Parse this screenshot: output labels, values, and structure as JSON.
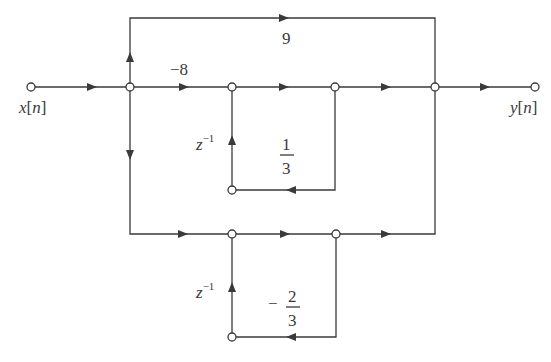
{
  "diagram": {
    "type": "signal-flow-graph",
    "input_label": {
      "var": "x",
      "open": "[",
      "idx": "n",
      "close": "]"
    },
    "output_label": {
      "var": "y",
      "open": "[",
      "idx": "n",
      "close": "]"
    },
    "gains": {
      "top_feedforward": "9",
      "middle_path": "−8",
      "upper_loop_num": "1",
      "upper_loop_den": "3",
      "lower_loop_sign": "−",
      "lower_loop_num": "2",
      "lower_loop_den": "3"
    },
    "delays": {
      "upper_z": "z",
      "upper_exp": "−1",
      "lower_z": "z",
      "lower_exp": "−1"
    },
    "colors": {
      "line": "#3a3a3a",
      "background": "#ffffff"
    }
  }
}
